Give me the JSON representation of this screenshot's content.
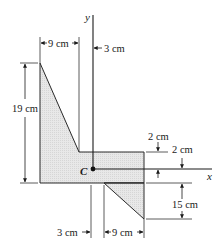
{
  "figure": {
    "type": "z-section cross-section diagram",
    "axes": {
      "x_label": "x",
      "y_label": "y"
    },
    "centroid_label": "C",
    "dimensions": {
      "top_left_width": "9 cm",
      "top_web_offset": "3 cm",
      "left_height": "19 cm",
      "flange_upper_thickness": "2 cm",
      "flange_lower_thickness": "2 cm",
      "right_height": "15 cm",
      "bottom_web_offset": "3 cm",
      "bottom_right_width": "9 cm"
    },
    "colors": {
      "fill": "#e6e6e6",
      "stroke": "#2a2a2a"
    }
  }
}
